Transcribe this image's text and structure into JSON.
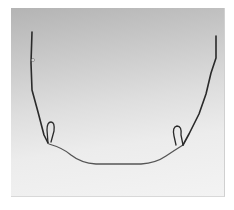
{
  "image": {
    "subject": "orthodontic wire appliance",
    "description": "U-shaped bent metal wire with two vertical loops, photographed on a gray gradient background",
    "colors": {
      "background_top": "#b4b4b4",
      "background_bottom": "#f3f3f3",
      "wire": "#2a2a2a",
      "page": "#ffffff"
    }
  }
}
